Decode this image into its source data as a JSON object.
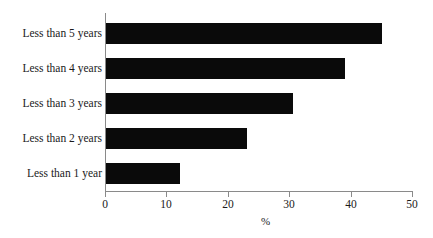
{
  "chart_data": {
    "type": "bar",
    "orientation": "horizontal",
    "title": "",
    "subtitle": "",
    "xlabel": "%",
    "ylabel": "",
    "categories": [
      "Less than 5 years",
      "Less than 4 years",
      "Less than 3 years",
      "Less than 2 years",
      "Less than 1 year"
    ],
    "values": [
      45,
      39,
      30.5,
      23,
      12
    ],
    "xlim": [
      0,
      50
    ],
    "xticks": [
      0,
      10,
      20,
      30,
      40,
      50
    ],
    "xtick_labels": [
      "0",
      "10",
      "20",
      "30",
      "40",
      "50"
    ],
    "grid": false,
    "legend": null,
    "bar_color": "#0a0a0a",
    "axis_color": "#8a8a8a",
    "text_color": "#1a1a1a",
    "background": "#ffffff"
  }
}
